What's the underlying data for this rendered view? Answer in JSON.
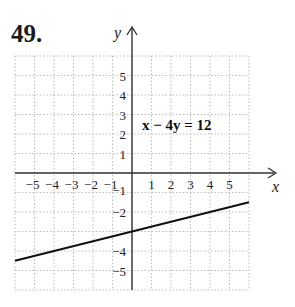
{
  "problem_number": "49.",
  "chart_data": {
    "type": "line",
    "title": "",
    "equation": "x − 4y = 12",
    "xlabel": "x",
    "ylabel": "y",
    "xlim": [
      -6,
      6
    ],
    "ylim": [
      -6,
      6
    ],
    "grid": true,
    "x_tick_labels": [
      "−5",
      "−4",
      "−3",
      "−2",
      "−1",
      "1",
      "2",
      "3",
      "4",
      "5"
    ],
    "y_tick_labels": [
      "5",
      "4",
      "3",
      "2",
      "1",
      "−1",
      "−2",
      "−4",
      "−5"
    ],
    "series": [
      {
        "name": "x − 4y = 12",
        "x": [
          -6,
          0,
          6
        ],
        "y": [
          -4.5,
          -3,
          -1.5
        ]
      }
    ]
  }
}
